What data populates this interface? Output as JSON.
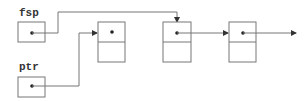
{
  "diagram": {
    "type": "linked-list-pointer-diagram",
    "variables": [
      {
        "id": "fsp",
        "label": "fsp",
        "points_to": "node-2"
      },
      {
        "id": "ptr",
        "label": "ptr",
        "points_to": "node-1"
      }
    ],
    "nodes": [
      {
        "id": "node-1",
        "fields": 2,
        "next": null
      },
      {
        "id": "node-2",
        "fields": 2,
        "next": "node-3"
      },
      {
        "id": "node-3",
        "fields": 2,
        "next": "off-diagram"
      }
    ],
    "colors": {
      "stroke": "#777777",
      "dot": "#222222",
      "text": "#333333",
      "background": "#ffffff"
    }
  }
}
